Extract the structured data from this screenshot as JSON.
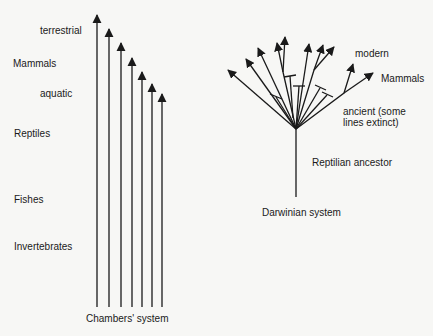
{
  "chambers": {
    "caption": "Chambers' system",
    "labels": {
      "terrestrial": "terrestrial",
      "mammals": "Mammals",
      "aquatic": "aquatic",
      "reptiles": "Reptiles",
      "fishes": "Fishes",
      "invertebrates": "Invertebrates"
    },
    "arrow_count": 7
  },
  "darwinian": {
    "caption": "Darwinian system",
    "labels": {
      "modern": "modern",
      "mammals": "Mammals",
      "ancient_line1": "ancient (some",
      "ancient_line2": "lines extinct)",
      "ancestor": "Reptilian ancestor"
    }
  },
  "colors": {
    "ink": "#1a1a1a",
    "background": "#f7f7f5"
  }
}
